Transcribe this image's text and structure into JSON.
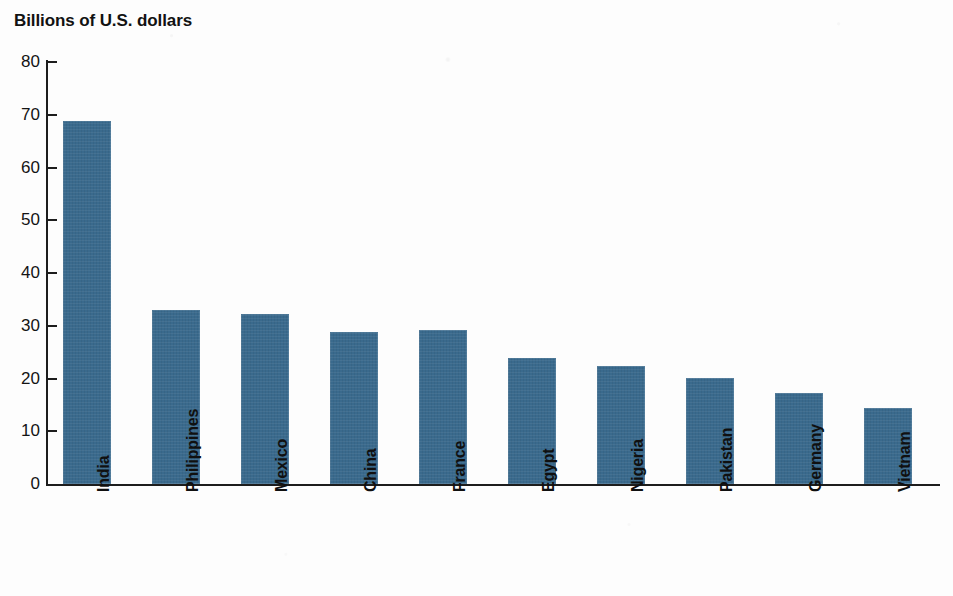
{
  "chart_data": {
    "type": "bar",
    "title": "Billions of U.S. dollars",
    "xlabel": "",
    "ylabel": "Billions of U.S. dollars",
    "ylim": [
      0,
      80
    ],
    "yticks": [
      0,
      10,
      20,
      30,
      40,
      50,
      60,
      70,
      80
    ],
    "ytick_labels": [
      "0",
      "10",
      "20",
      "30",
      "40",
      "50",
      "60",
      "70",
      "80"
    ],
    "grid": false,
    "legend": null,
    "bar_color": "#3a6a8d",
    "axis_color": "#1d1d1d",
    "background_color": "#fdfdfd",
    "categories": [
      "India",
      "Philippines",
      "Mexico",
      "China",
      "France",
      "Egypt",
      "Nigeria",
      "Pakistan",
      "Germany",
      "Vietnam"
    ],
    "values": [
      68.8,
      33.0,
      32.3,
      28.9,
      29.2,
      23.9,
      22.3,
      20.1,
      17.2,
      14.4
    ],
    "series": [
      {
        "name": "Remittances received",
        "values": [
          68.8,
          33.0,
          32.3,
          28.9,
          29.2,
          23.9,
          22.3,
          20.1,
          17.2,
          14.4
        ]
      }
    ]
  },
  "chart": {
    "title": "Billions of U.S. dollars"
  }
}
